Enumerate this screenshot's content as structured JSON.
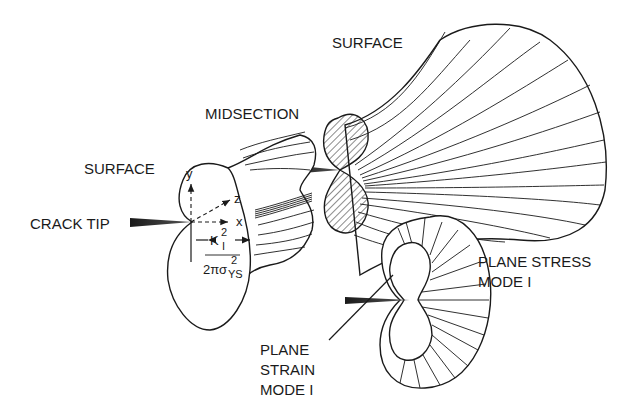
{
  "diagram": {
    "labels": {
      "surface_top": "SURFACE",
      "midsection": "MIDSECTION",
      "surface_left": "SURFACE",
      "crack_tip": "CRACK TIP",
      "plane_stress_line1": "PLANE STRESS",
      "plane_stress_line2": "MODE I",
      "plane_strain_line1": "PLANE",
      "plane_strain_line2": "STRAIN",
      "plane_strain_line3": "MODE I"
    },
    "axes": {
      "y": "y",
      "z": "z",
      "x": "x"
    },
    "dimension": {
      "numerator_base": "K",
      "numerator_sup": "2",
      "numerator_sub": "I",
      "denominator_base": "2πσ",
      "denominator_sup": "2",
      "denominator_sub": "YS"
    },
    "colors": {
      "ink": "#1a1a1a",
      "background": "#ffffff"
    }
  }
}
